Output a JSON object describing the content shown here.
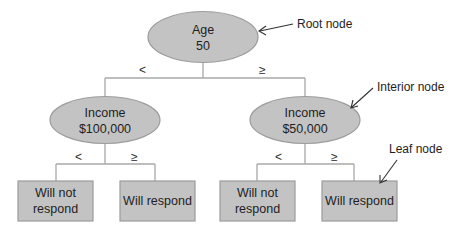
{
  "diagram": {
    "type": "decision-tree",
    "colors": {
      "node_fill": "#c3c3c3",
      "node_stroke": "#9c9c9c",
      "line": "#a8a8a8",
      "text": "#1e1e1e"
    },
    "root": {
      "line1": "Age",
      "line2": "50"
    },
    "root_branches": {
      "left": "<",
      "right": "≥"
    },
    "interior": [
      {
        "line1": "Income",
        "line2": "$100,000",
        "left_op": "<",
        "right_op": "≥"
      },
      {
        "line1": "Income",
        "line2": "$50,000",
        "left_op": "<",
        "right_op": "≥"
      }
    ],
    "leaves": [
      {
        "line1": "Will not",
        "line2": "respond"
      },
      {
        "line1": "Will respond",
        "line2": ""
      },
      {
        "line1": "Will not",
        "line2": "respond"
      },
      {
        "line1": "Will respond",
        "line2": ""
      }
    ],
    "annotations": {
      "root": "Root node",
      "interior": "Interior node",
      "leaf": "Leaf node"
    }
  }
}
